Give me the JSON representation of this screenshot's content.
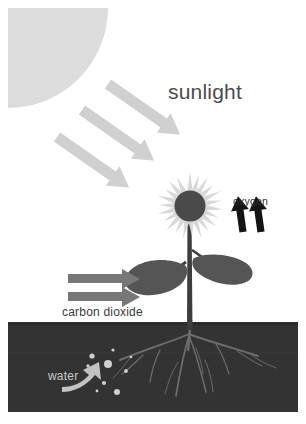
{
  "diagram": {
    "canvas": {
      "width": 306,
      "height": 424,
      "background": "#ffffff"
    },
    "labels": {
      "sunlight": "sunlight",
      "oxygen": "oxygen",
      "carbon_dioxide": "carbon dioxide",
      "water": "water"
    },
    "colors": {
      "background": "#ffffff",
      "sun": "#dcdcdc",
      "sunbeam_arrow": "#d0d0d0",
      "petal": "#d8d8d8",
      "flower_center": "#4a4a4a",
      "leaf": "#555555",
      "stem": "#3d3d3d",
      "soil": "#333333",
      "root": "#6e6e6e",
      "water_droplet": "#cfcfcf",
      "water_arrow": "#c2c2c2",
      "co2_arrow": "#777777",
      "oxygen_arrow": "#141414",
      "sunlight_text": "#4b4b4b",
      "oxygen_text": "#2e2e2e",
      "carbon_dioxide_text": "#3a3a3a",
      "water_text": "#c9c9c9"
    },
    "elements": {
      "sun": {
        "name": "sun",
        "shape": "quarter-circle",
        "corner": "top-left",
        "radius": 100
      },
      "sunbeams": {
        "name": "sunlight-arrows",
        "count": 3,
        "direction": "down-right",
        "angle_deg": 35
      },
      "flower": {
        "name": "flower",
        "petal_count": 22,
        "center_radius": 16
      },
      "leaves": {
        "name": "leaves",
        "count": 2,
        "sides": [
          "left",
          "right"
        ]
      },
      "co2_arrows": {
        "name": "carbon-dioxide-arrows",
        "count": 2,
        "direction": "right"
      },
      "oxygen_arrows": {
        "name": "oxygen-arrows",
        "count": 2,
        "direction": "up"
      },
      "soil": {
        "name": "soil-band",
        "top_y": 322,
        "bottom_y": 412
      },
      "roots": {
        "name": "root-system",
        "branches": 7
      },
      "water_droplets": {
        "name": "water-droplets",
        "count": 9
      },
      "water_arrow": {
        "name": "water-arrow",
        "direction": "curved-up-right"
      }
    }
  }
}
